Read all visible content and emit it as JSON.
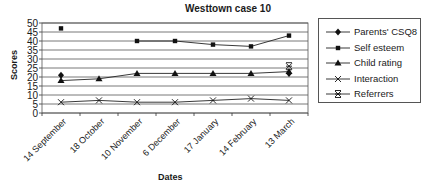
{
  "chart_data": {
    "type": "line",
    "title": "Westtown case 10",
    "xlabel": "Dates",
    "ylabel": "Scores",
    "ylim": [
      0,
      50
    ],
    "yticks": [
      0,
      5,
      10,
      15,
      20,
      25,
      30,
      35,
      40,
      45,
      50
    ],
    "grid": true,
    "legend_position": "right",
    "categories": [
      "14 September",
      "18 October",
      "10 November",
      "6 December",
      "17 January",
      "14 February",
      "13 March"
    ],
    "series": [
      {
        "name": "Parents' CSQ8",
        "marker": "diamond",
        "values": [
          21,
          null,
          null,
          null,
          null,
          null,
          22
        ]
      },
      {
        "name": "Self esteem",
        "marker": "square",
        "values": [
          47,
          null,
          40,
          40,
          38,
          37,
          43
        ]
      },
      {
        "name": "Child rating",
        "marker": "triangle",
        "values": [
          18,
          19,
          22,
          22,
          22,
          22,
          23
        ]
      },
      {
        "name": "Interaction",
        "marker": "x",
        "values": [
          6,
          7,
          6,
          6,
          7,
          8,
          7
        ]
      },
      {
        "name": "Referrers",
        "marker": "star",
        "values": [
          null,
          null,
          null,
          null,
          null,
          null,
          26
        ]
      }
    ]
  }
}
